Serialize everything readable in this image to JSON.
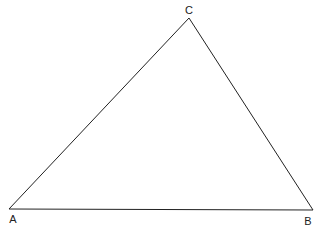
{
  "diagram": {
    "type": "triangle",
    "stroke_color": "#222222",
    "background": "#ffffff",
    "vertices": [
      {
        "id": "A",
        "label": "A",
        "x": 9,
        "y": 209,
        "label_x": 13,
        "label_y": 223
      },
      {
        "id": "B",
        "label": "B",
        "x": 313,
        "y": 210,
        "label_x": 308,
        "label_y": 225
      },
      {
        "id": "C",
        "label": "C",
        "x": 189,
        "y": 18,
        "label_x": 189,
        "label_y": 14
      }
    ],
    "edges": [
      {
        "from": "A",
        "to": "B"
      },
      {
        "from": "B",
        "to": "C"
      },
      {
        "from": "C",
        "to": "A"
      }
    ]
  }
}
